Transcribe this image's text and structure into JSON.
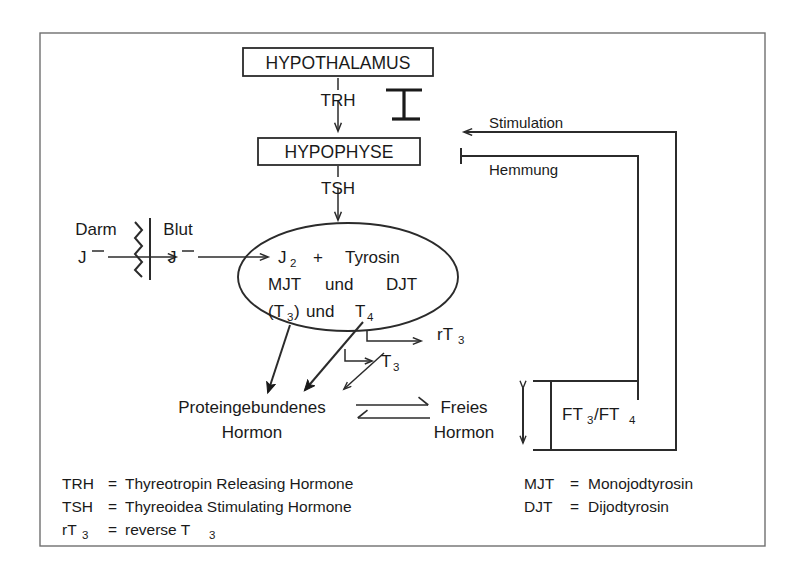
{
  "figure": {
    "title_nodes": {
      "hypothalamus": "HYPOTHALAMUS",
      "hypophyse": "HYPOPHYSE"
    },
    "hormone_arrows": {
      "trh": "TRH",
      "tsh": "TSH"
    },
    "compartments": {
      "darm": "Darm",
      "blut": "Blut",
      "iodide_darm": "J",
      "iodide_darm_charge": "–",
      "iodide_blut": "J",
      "iodide_blut_charge": "–"
    },
    "thyroid_ellipse": {
      "row1_a": "J",
      "row1_a_sub": "2",
      "row1_plus": "+",
      "row1_b": "Tyrosin",
      "row2_a": "MJT",
      "row2_und": "und",
      "row2_b": "DJT",
      "row3_a": "(T",
      "row3_a_sub": "3",
      "row3_a_end": ")",
      "row3_und": "und",
      "row3_b": "T",
      "row3_b_sub": "4"
    },
    "products": {
      "rt3": "rT",
      "rt3_sub": "3",
      "t3": "T",
      "t3_sub": "3"
    },
    "hormone_pool": {
      "bound_line1": "Proteingebundenes",
      "bound_line2": "Hormon",
      "free_line1": "Freies",
      "free_line2": "Hormon"
    },
    "feedback": {
      "stimulation": "Stimulation",
      "hemmung": "Hemmung",
      "ft_label_a": "FT",
      "ft_label_a_sub": "3",
      "ft_label_slash": "/FT",
      "ft_label_b_sub": "4"
    },
    "legend_left": [
      {
        "abbr": "TRH",
        "abbr_sub": "",
        "eq": "=",
        "text": "Thyreotropin Releasing Hormone"
      },
      {
        "abbr": "TSH",
        "abbr_sub": "",
        "eq": "=",
        "text": "Thyreoidea Stimulating Hormone"
      },
      {
        "abbr": "rT",
        "abbr_sub": "3",
        "eq": "=",
        "text": "reverse T",
        "text_sub": "3"
      }
    ],
    "legend_right": [
      {
        "abbr": "MJT",
        "eq": "=",
        "text": "Monojodtyrosin"
      },
      {
        "abbr": "DJT",
        "eq": "=",
        "text": "Dijodtyrosin"
      }
    ],
    "colors": {
      "ink": "#1a1a1a",
      "line": "#2b2b2b",
      "frame": "#6f6f6f",
      "background": "#ffffff"
    }
  }
}
